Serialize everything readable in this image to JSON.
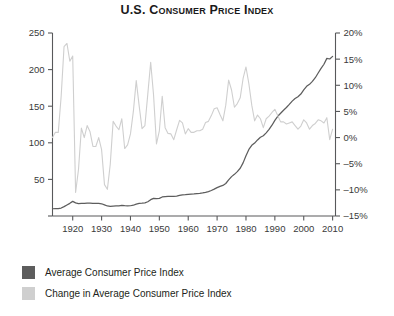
{
  "title": "U.S. Consumer Price Index",
  "legend": {
    "items": [
      {
        "label": "Average Consumer Price Index",
        "color": "#5d5d5d",
        "swatch": "dark-gray-swatch"
      },
      {
        "label": "Change in Average Consumer Price Index",
        "color": "#cfcfcf",
        "swatch": "light-gray-swatch"
      }
    ]
  },
  "chart_data": {
    "type": "line",
    "title": "U.S. Consumer Price Index",
    "xlabel": "",
    "ylabel": "",
    "grid": false,
    "legend_position": "below-plot",
    "xlim": [
      1913,
      2011
    ],
    "x_ticks": [
      1920,
      1930,
      1940,
      1950,
      1960,
      1970,
      1980,
      1990,
      2000,
      2010
    ],
    "x_tick_labels": [
      "1920",
      "1930",
      "1940",
      "1950",
      "1960",
      "1970",
      "1980",
      "1990",
      "2000",
      "2010"
    ],
    "axes": [
      {
        "name": "left-axis",
        "series": "Average Consumer Price Index",
        "ylim": [
          0,
          250
        ],
        "ticks": [
          0,
          50,
          100,
          150,
          200,
          250
        ],
        "tick_labels": [
          "",
          "50",
          "100",
          "150",
          "200",
          "250"
        ]
      },
      {
        "name": "right-axis",
        "series": "Change in Average Consumer Price Index",
        "ylim": [
          -15,
          20
        ],
        "ticks": [
          -15,
          -10,
          -5,
          0,
          5,
          10,
          15,
          20
        ],
        "tick_labels": [
          "-15%",
          "-10%",
          "-5%",
          "0%",
          "5%",
          "10%",
          "15%",
          "20%"
        ]
      }
    ],
    "x": [
      1913,
      1914,
      1915,
      1916,
      1917,
      1918,
      1919,
      1920,
      1921,
      1922,
      1923,
      1924,
      1925,
      1926,
      1927,
      1928,
      1929,
      1930,
      1931,
      1932,
      1933,
      1934,
      1935,
      1936,
      1937,
      1938,
      1939,
      1940,
      1941,
      1942,
      1943,
      1944,
      1945,
      1946,
      1947,
      1948,
      1949,
      1950,
      1951,
      1952,
      1953,
      1954,
      1955,
      1956,
      1957,
      1958,
      1959,
      1960,
      1961,
      1962,
      1963,
      1964,
      1965,
      1966,
      1967,
      1968,
      1969,
      1970,
      1971,
      1972,
      1973,
      1974,
      1975,
      1976,
      1977,
      1978,
      1979,
      1980,
      1981,
      1982,
      1983,
      1984,
      1985,
      1986,
      1987,
      1988,
      1989,
      1990,
      1991,
      1992,
      1993,
      1994,
      1995,
      1996,
      1997,
      1998,
      1999,
      2000,
      2001,
      2002,
      2003,
      2004,
      2005,
      2006,
      2007,
      2008,
      2009,
      2010
    ],
    "series": [
      {
        "name": "Average Consumer Price Index",
        "axis": "left",
        "color": "#5d5d5d",
        "units": "index (1982-84 = 100)",
        "values": [
          9.9,
          10.0,
          10.1,
          10.9,
          12.8,
          15.1,
          17.3,
          20.0,
          17.9,
          16.8,
          17.1,
          17.1,
          17.5,
          17.7,
          17.4,
          17.1,
          17.1,
          16.7,
          15.2,
          13.7,
          13.0,
          13.4,
          13.7,
          13.9,
          14.4,
          14.1,
          13.9,
          14.0,
          14.7,
          16.3,
          17.3,
          17.6,
          18.0,
          19.5,
          22.3,
          24.1,
          23.8,
          24.1,
          26.0,
          26.5,
          26.7,
          26.9,
          26.8,
          27.2,
          28.1,
          28.9,
          29.1,
          29.6,
          29.9,
          30.2,
          30.6,
          31.0,
          31.5,
          32.4,
          33.4,
          34.8,
          36.7,
          38.8,
          40.5,
          41.8,
          44.4,
          49.3,
          53.8,
          56.9,
          60.6,
          65.2,
          72.6,
          82.4,
          90.9,
          96.5,
          99.6,
          103.9,
          107.6,
          109.6,
          113.6,
          118.3,
          124.0,
          130.7,
          136.2,
          140.3,
          144.5,
          148.2,
          152.4,
          156.9,
          160.5,
          163.0,
          166.6,
          172.2,
          177.1,
          179.9,
          184.0,
          188.9,
          195.3,
          201.6,
          207.3,
          215.3,
          214.5,
          218.1
        ]
      },
      {
        "name": "Change in Average Consumer Price Index",
        "axis": "right",
        "color": "#cfcfcf",
        "units": "percent",
        "values": [
          0.0,
          1.0,
          1.0,
          7.9,
          17.4,
          18.0,
          14.6,
          15.6,
          -10.5,
          -6.1,
          1.8,
          0.0,
          2.3,
          1.1,
          -1.7,
          -1.7,
          0.0,
          -2.3,
          -9.0,
          -9.9,
          -5.1,
          3.1,
          2.2,
          1.5,
          3.6,
          -2.1,
          -1.4,
          0.7,
          5.0,
          10.9,
          6.1,
          1.7,
          2.3,
          8.3,
          14.4,
          8.1,
          -1.2,
          1.3,
          7.9,
          1.9,
          0.8,
          0.7,
          -0.4,
          1.5,
          3.3,
          2.8,
          0.7,
          1.7,
          1.0,
          1.0,
          1.3,
          1.3,
          1.6,
          2.9,
          3.1,
          4.2,
          5.5,
          5.7,
          4.4,
          3.2,
          6.2,
          11.0,
          9.1,
          5.8,
          6.5,
          7.6,
          11.3,
          13.5,
          10.3,
          6.2,
          3.2,
          4.3,
          3.6,
          1.9,
          3.6,
          4.1,
          4.8,
          5.4,
          4.2,
          3.0,
          3.0,
          2.6,
          2.8,
          3.0,
          2.3,
          1.6,
          2.2,
          3.4,
          2.8,
          1.6,
          2.3,
          2.7,
          3.4,
          3.2,
          2.8,
          3.8,
          -0.4,
          1.6
        ]
      }
    ]
  }
}
